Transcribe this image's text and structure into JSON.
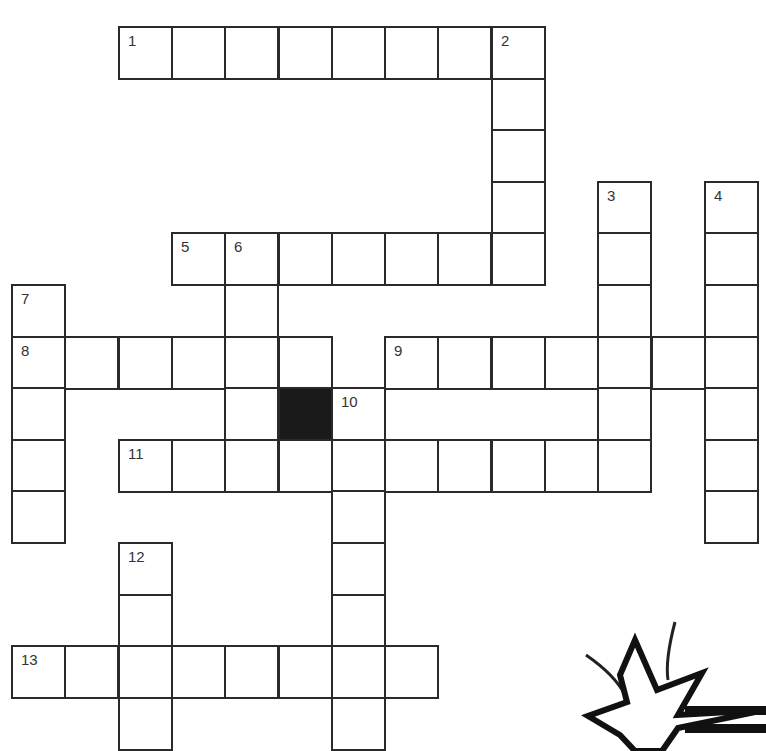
{
  "puzzle": {
    "type": "crossword",
    "grid": {
      "origin_x": 11,
      "origin_y": 26,
      "cell_w": 53.3,
      "cell_h": 51.6,
      "cols": 14,
      "rows": 14
    },
    "entries": [
      {
        "number": "1",
        "direction": "across",
        "row": 0,
        "col": 2,
        "length": 8
      },
      {
        "number": "2",
        "direction": "down",
        "row": 0,
        "col": 9,
        "length": 5
      },
      {
        "number": "3",
        "direction": "down",
        "row": 3,
        "col": 11,
        "length": 6
      },
      {
        "number": "4",
        "direction": "down",
        "row": 3,
        "col": 13,
        "length": 7
      },
      {
        "number": "5",
        "direction": "across",
        "row": 4,
        "col": 3,
        "length": 7
      },
      {
        "number": "6",
        "direction": "down",
        "row": 4,
        "col": 4,
        "length": 5
      },
      {
        "number": "7",
        "direction": "down",
        "row": 5,
        "col": 0,
        "length": 5
      },
      {
        "number": "8",
        "direction": "across",
        "row": 6,
        "col": 0,
        "length": 6
      },
      {
        "number": "9",
        "direction": "across",
        "row": 6,
        "col": 7,
        "length": 7
      },
      {
        "number": "10",
        "direction": "down",
        "row": 7,
        "col": 6,
        "length": 7
      },
      {
        "number": "11",
        "direction": "across",
        "row": 8,
        "col": 2,
        "length": 10
      },
      {
        "number": "12",
        "direction": "down",
        "row": 10,
        "col": 2,
        "length": 4
      },
      {
        "number": "13",
        "direction": "across",
        "row": 12,
        "col": 0,
        "length": 8
      }
    ],
    "black_cells": [
      {
        "row": 7,
        "col": 5
      }
    ]
  },
  "decoration": {
    "starburst_icon": "starburst-icon"
  }
}
